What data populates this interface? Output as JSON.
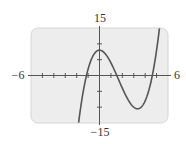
{
  "chart_data": {
    "type": "line",
    "title": "",
    "function": "x^3 - 5x^2 + 8",
    "xlabel": "",
    "ylabel": "",
    "xlim": [
      -6,
      6
    ],
    "ylim": [
      -15,
      15
    ],
    "x_tick_step": 1,
    "y_tick_step": 5,
    "axis_labels": {
      "x_min": "−6",
      "x_max": "6",
      "y_max": "15",
      "y_min": "−15"
    },
    "grid": false,
    "legend": null,
    "key_points": {
      "local_max": {
        "x": 0,
        "y": 8
      },
      "local_min": {
        "x": 3.33,
        "y": -10.5
      },
      "roots": [
        -1.14,
        1.5,
        4.63
      ]
    },
    "series": [
      {
        "name": "curve",
        "x": [
          -2.2,
          -2.0,
          -1.5,
          -1.0,
          -0.5,
          0,
          0.5,
          1.0,
          1.5,
          2.0,
          2.5,
          3.0,
          3.33,
          3.5,
          4.0,
          4.5,
          5.0,
          5.3
        ],
        "values": [
          -15.85,
          -20.0,
          -6.63,
          2.0,
          6.63,
          8.0,
          6.88,
          4.0,
          0.13,
          -4.0,
          -7.63,
          -10.0,
          -10.5,
          -10.38,
          -8.0,
          -2.13,
          8.0,
          14.4
        ]
      }
    ]
  },
  "colors": {
    "background": "#ffffff",
    "plot_fill": "#ededed",
    "plot_border": "#d6d6d6",
    "axis": "#555555",
    "curve": "#555555"
  }
}
